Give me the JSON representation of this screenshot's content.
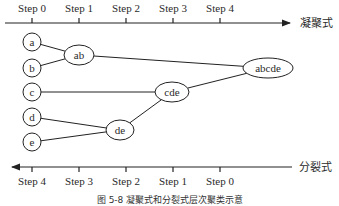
{
  "diagram": {
    "type": "hierarchical-clustering",
    "agglomerative": {
      "label": "凝聚式",
      "direction": "left-to-right",
      "steps": [
        "Step 0",
        "Step 1",
        "Step 2",
        "Step 3",
        "Step 4"
      ]
    },
    "divisive": {
      "label": "分裂式",
      "direction": "right-to-left",
      "steps": [
        "Step 4",
        "Step 3",
        "Step 2",
        "Step 1",
        "Step 0"
      ]
    },
    "nodes": [
      {
        "id": "a",
        "label": "a",
        "step": 0
      },
      {
        "id": "b",
        "label": "b",
        "step": 0
      },
      {
        "id": "c",
        "label": "c",
        "step": 0
      },
      {
        "id": "d",
        "label": "d",
        "step": 0
      },
      {
        "id": "e",
        "label": "e",
        "step": 0
      },
      {
        "id": "ab",
        "label": "ab",
        "step": 1
      },
      {
        "id": "de",
        "label": "de",
        "step": 2
      },
      {
        "id": "cde",
        "label": "cde",
        "step": 3
      },
      {
        "id": "abcde",
        "label": "abcde",
        "step": 4
      }
    ],
    "edges": [
      {
        "from": "a",
        "to": "ab"
      },
      {
        "from": "b",
        "to": "ab"
      },
      {
        "from": "d",
        "to": "de"
      },
      {
        "from": "e",
        "to": "de"
      },
      {
        "from": "c",
        "to": "cde"
      },
      {
        "from": "de",
        "to": "cde"
      },
      {
        "from": "ab",
        "to": "abcde"
      },
      {
        "from": "cde",
        "to": "abcde"
      }
    ],
    "caption": "图 5-8 凝聚式和分裂式层次聚类示意"
  }
}
